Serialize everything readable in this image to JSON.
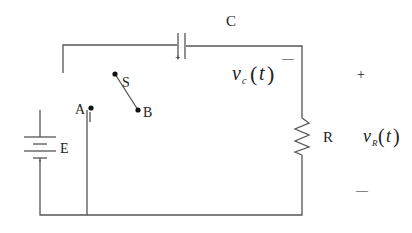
{
  "diagram": {
    "type": "RC circuit with battery and switch",
    "wire_color": "#555555",
    "text_color": "#222222",
    "components": {
      "capacitor": {
        "label": "C",
        "polarity_mark": "+"
      },
      "resistor": {
        "label": "R"
      },
      "battery": {
        "label": "E"
      },
      "switch": {
        "label": "S",
        "terminal_a": "A",
        "terminal_b": "B"
      }
    },
    "voltages": {
      "capacitor_voltage": {
        "symbol": "v",
        "subscript": "c",
        "arg": "t",
        "sign_minus": "—"
      },
      "resistor_voltage": {
        "symbol": "v",
        "subscript": "R",
        "arg": "t",
        "sign_plus": "+",
        "sign_minus": "—"
      }
    }
  }
}
